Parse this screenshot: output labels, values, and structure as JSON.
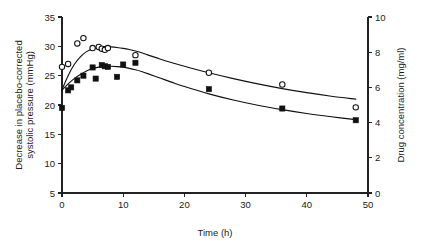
{
  "chart_data": {
    "type": "scatter",
    "title": "",
    "subtitle": "",
    "xlabel": "Time (h)",
    "ylabel": "Decrease in placebo-corrected systolic pressure (mmHg)",
    "ylabel_line1": "Decrease in placebo-corrected",
    "ylabel_line2": "systolic pressure (mmHg)",
    "y2label": "Drug concentration (mg/ml)",
    "xlim": [
      0,
      50
    ],
    "ylim": [
      5,
      35
    ],
    "y2lim": [
      0,
      10
    ],
    "xticks": [
      0,
      10,
      20,
      30,
      40,
      50
    ],
    "xtick_labels": [
      "0",
      "10",
      "20",
      "30",
      "40",
      "50"
    ],
    "yticks": [
      5,
      10,
      15,
      20,
      25,
      30,
      35
    ],
    "ytick_labels": [
      "5",
      "10",
      "15",
      "20",
      "25",
      "30",
      "35"
    ],
    "y2ticks": [
      0,
      2,
      4,
      6,
      8,
      10
    ],
    "y2tick_labels": [
      "0",
      "2",
      "4",
      "6",
      "8",
      "10"
    ],
    "grid": false,
    "legend": "none",
    "series": [
      {
        "name": "Drug concentration",
        "marker": "open-circle",
        "axis": "right",
        "x": [
          0,
          1,
          2.5,
          3.5,
          5,
          6,
          6.5,
          7,
          7.5,
          12,
          24,
          36,
          48
        ],
        "values": [
          26.5,
          27.0,
          30.5,
          31.4,
          29.7,
          29.9,
          29.6,
          29.4,
          29.7,
          28.5,
          25.5,
          23.5,
          19.6
        ],
        "values_right_axis": [
          7.17,
          7.33,
          8.5,
          8.8,
          8.23,
          8.3,
          8.2,
          8.13,
          8.23,
          7.83,
          6.83,
          6.17,
          4.87
        ]
      },
      {
        "name": "Decrease in placebo-corrected systolic pressure",
        "marker": "filled-square",
        "axis": "left",
        "x": [
          0,
          1,
          1.5,
          2.5,
          3.5,
          5,
          5.5,
          6.5,
          7,
          7.5,
          9,
          10,
          12,
          24,
          36,
          48
        ],
        "values": [
          19.5,
          22.5,
          23.0,
          24.2,
          25.0,
          26.4,
          24.5,
          26.8,
          26.6,
          26.5,
          24.8,
          26.9,
          27.2,
          22.7,
          19.4,
          17.4
        ]
      }
    ],
    "fit_curves": [
      {
        "name": "drug-concentration-fit",
        "x": [
          0,
          1,
          2,
          3,
          4,
          5,
          6,
          7,
          8,
          9,
          10,
          11,
          12,
          13,
          14,
          16,
          18,
          20,
          24,
          28,
          32,
          36,
          40,
          44,
          48
        ],
        "values": [
          22.6,
          25.0,
          26.9,
          28.2,
          29.1,
          29.6,
          29.85,
          29.95,
          29.9,
          29.8,
          29.65,
          29.45,
          29.2,
          28.9,
          28.55,
          27.85,
          27.2,
          26.6,
          25.5,
          24.5,
          23.6,
          22.8,
          22.1,
          21.5,
          21.0
        ]
      },
      {
        "name": "blood-pressure-fit",
        "x": [
          0,
          1,
          2,
          3,
          4,
          5,
          6,
          7,
          8,
          9,
          10,
          11,
          12,
          13,
          14,
          16,
          18,
          20,
          24,
          28,
          32,
          36,
          40,
          44,
          48
        ],
        "values": [
          22.5,
          23.6,
          24.5,
          25.2,
          25.8,
          26.2,
          26.45,
          26.6,
          26.6,
          26.55,
          26.45,
          26.25,
          26.0,
          25.7,
          25.35,
          24.6,
          23.85,
          23.15,
          21.9,
          20.85,
          19.95,
          19.2,
          18.55,
          18.0,
          17.5
        ]
      }
    ]
  }
}
